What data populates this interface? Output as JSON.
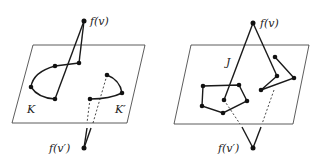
{
  "panels": [
    {
      "id": "left",
      "labels": {
        "fv": "f(v)",
        "fv_prime": "f(v′)",
        "K": "K",
        "K_prime": "K′"
      }
    },
    {
      "id": "right",
      "labels": {
        "fv": "f(v)",
        "fv_prime": "f(v′)",
        "J": "J"
      }
    }
  ],
  "colors": {
    "stroke": "#1a1a1a",
    "plane": "#333333",
    "background": "#ffffff"
  }
}
